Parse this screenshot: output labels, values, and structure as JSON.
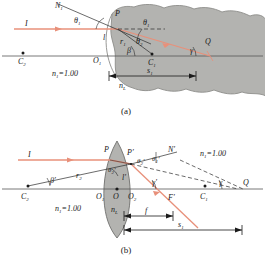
{
  "figure": {
    "type": "optics-ray-diagram",
    "panels": [
      {
        "caption": "(a)",
        "title_semantic": "refraction-at-single-spherical-surface",
        "labels": {
          "incident_ray": "I",
          "normal": "N",
          "normal_sub": "1",
          "angle_incidence": "θ",
          "angle_incidence_sub": "1",
          "angle_refraction": "θ",
          "angle_refraction_sub": "2",
          "point_p": "P",
          "point_q": "Q",
          "center_c1": "C",
          "center_c1_sub": "1",
          "center_c2": "C",
          "center_c2_sub": "2",
          "vertex_o1": "O",
          "vertex_o1_sub": "1",
          "radius_r1": "r",
          "radius_r1_sub": "1",
          "height_l": "l",
          "angle_beta": "β",
          "angle_gamma": "γ",
          "index_outside": "n",
          "index_outside_sub": "1",
          "index_outside_value": "=1.00",
          "index_lens": "n",
          "index_lens_sub": "L",
          "distance_s1": "s",
          "distance_s1_sub": "1"
        }
      },
      {
        "caption": "(b)",
        "title_semantic": "refraction-through-thin-biconvex-lens",
        "labels": {
          "incident_ray": "I",
          "normal": "N",
          "normal_prime": "′",
          "angle_t1p": "θ",
          "angle_t1p_sub": "1",
          "angle_t1p_prime": "′",
          "angle_t2p": "θ",
          "angle_t2p_sub": "2",
          "angle_t2p_prime": "′",
          "angle_t2p_in": "θ",
          "angle_t2p_in_sub": "2",
          "angle_t2p_in_prime": "′",
          "point_p": "P",
          "point_p_prime": "P′",
          "point_q": "Q",
          "center_c1": "C",
          "center_c1_sub": "1",
          "center_c2": "C",
          "center_c2_sub": "2",
          "vertex_o1": "O",
          "vertex_o1_sub": "1",
          "vertex_o": "O",
          "vertex_o2": "O",
          "vertex_o2_sub": "2",
          "focus_f_prime": "F′",
          "radius_r2": "r",
          "radius_r2_sub": "2",
          "height_l_prime": "l′",
          "angle_beta_prime": "β′",
          "angle_gamma_prime": "γ′",
          "angle_gamma": "γ",
          "index_left": "n",
          "index_left_sub": "1",
          "index_left_value": "=1.00",
          "index_right": "n",
          "index_right_sub": "1",
          "index_right_value": "=1.00",
          "index_lens": "n",
          "index_lens_sub": "L",
          "focal_length": "f",
          "distance_s1": "s",
          "distance_s1_sub": "1"
        }
      }
    ]
  },
  "colors": {
    "ray": "#e8907a",
    "medium_fill": "#b3b3b0",
    "medium_stroke": "#8d8d8a",
    "ink": "#1a1a1a",
    "axis": "#555555"
  }
}
